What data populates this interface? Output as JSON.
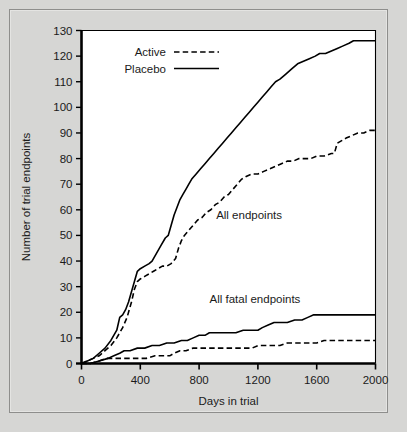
{
  "figure": {
    "background_color": "#d6d6d4",
    "plot_background_color": "#ffffff",
    "frame_border_color": "#8e8e8c",
    "ink_color": "#000000"
  },
  "chart_data": {
    "type": "line",
    "title": "",
    "xlabel": "Days in trial",
    "ylabel": "Number of trial endpoints",
    "xlim": [
      0,
      2000
    ],
    "ylim": [
      0,
      130
    ],
    "xticks": [
      0,
      400,
      800,
      1200,
      1600,
      2000
    ],
    "yticks": [
      0,
      10,
      20,
      30,
      40,
      50,
      60,
      70,
      80,
      90,
      100,
      110,
      120,
      130
    ],
    "xtick_labels": [
      "0",
      "400",
      "800",
      "1200",
      "1600",
      "2000"
    ],
    "ytick_labels": [
      "0",
      "10",
      "20",
      "30",
      "40",
      "50",
      "60",
      "70",
      "80",
      "90",
      "100",
      "110",
      "120",
      "130"
    ],
    "grid": false,
    "legend_position": "upper left inside",
    "legend": [
      {
        "name": "Active",
        "style": "dashed"
      },
      {
        "name": "Placebo",
        "style": "solid"
      }
    ],
    "annotations": [
      {
        "text": "All endpoints",
        "x": 1140,
        "y": 58
      },
      {
        "text": "All fatal endpoints",
        "x": 1180,
        "y": 25
      }
    ],
    "series": [
      {
        "name": "Placebo - All endpoints",
        "group": "All endpoints",
        "arm": "Placebo",
        "style": "solid",
        "final_value": 126,
        "points": [
          [
            0,
            0
          ],
          [
            40,
            1
          ],
          [
            80,
            2
          ],
          [
            120,
            4
          ],
          [
            160,
            6
          ],
          [
            200,
            9
          ],
          [
            240,
            13
          ],
          [
            260,
            18
          ],
          [
            280,
            19
          ],
          [
            300,
            21
          ],
          [
            320,
            24
          ],
          [
            340,
            28
          ],
          [
            360,
            32
          ],
          [
            380,
            36
          ],
          [
            400,
            37
          ],
          [
            430,
            38
          ],
          [
            460,
            39
          ],
          [
            480,
            40
          ],
          [
            510,
            43
          ],
          [
            540,
            46
          ],
          [
            570,
            49
          ],
          [
            590,
            50
          ],
          [
            610,
            54
          ],
          [
            630,
            58
          ],
          [
            650,
            61
          ],
          [
            670,
            64
          ],
          [
            690,
            66
          ],
          [
            710,
            68
          ],
          [
            730,
            70
          ],
          [
            750,
            72
          ],
          [
            780,
            74
          ],
          [
            810,
            76
          ],
          [
            840,
            78
          ],
          [
            870,
            80
          ],
          [
            900,
            82
          ],
          [
            930,
            84
          ],
          [
            960,
            86
          ],
          [
            990,
            88
          ],
          [
            1020,
            90
          ],
          [
            1050,
            92
          ],
          [
            1080,
            94
          ],
          [
            1110,
            96
          ],
          [
            1140,
            98
          ],
          [
            1170,
            100
          ],
          [
            1200,
            102
          ],
          [
            1230,
            104
          ],
          [
            1260,
            106
          ],
          [
            1290,
            108
          ],
          [
            1320,
            110
          ],
          [
            1350,
            111
          ],
          [
            1390,
            113
          ],
          [
            1430,
            115
          ],
          [
            1470,
            117
          ],
          [
            1510,
            118
          ],
          [
            1550,
            119
          ],
          [
            1590,
            120
          ],
          [
            1620,
            121
          ],
          [
            1660,
            121
          ],
          [
            1700,
            122
          ],
          [
            1740,
            123
          ],
          [
            1780,
            124
          ],
          [
            1820,
            125
          ],
          [
            1850,
            126
          ],
          [
            1900,
            126
          ],
          [
            1950,
            126
          ],
          [
            2000,
            126
          ]
        ]
      },
      {
        "name": "Active - All endpoints",
        "group": "All endpoints",
        "arm": "Active",
        "style": "dashed",
        "final_value": 91,
        "points": [
          [
            0,
            0
          ],
          [
            40,
            1
          ],
          [
            80,
            2
          ],
          [
            120,
            3
          ],
          [
            160,
            5
          ],
          [
            200,
            7
          ],
          [
            240,
            10
          ],
          [
            280,
            14
          ],
          [
            310,
            18
          ],
          [
            340,
            24
          ],
          [
            360,
            29
          ],
          [
            380,
            32
          ],
          [
            400,
            33
          ],
          [
            430,
            34
          ],
          [
            460,
            35
          ],
          [
            490,
            36
          ],
          [
            520,
            37
          ],
          [
            550,
            38
          ],
          [
            580,
            38
          ],
          [
            610,
            39
          ],
          [
            640,
            41
          ],
          [
            660,
            45
          ],
          [
            680,
            48
          ],
          [
            700,
            50
          ],
          [
            730,
            52
          ],
          [
            760,
            54
          ],
          [
            790,
            56
          ],
          [
            820,
            57
          ],
          [
            850,
            59
          ],
          [
            880,
            60
          ],
          [
            910,
            62
          ],
          [
            940,
            63
          ],
          [
            970,
            65
          ],
          [
            1000,
            66
          ],
          [
            1030,
            68
          ],
          [
            1060,
            70
          ],
          [
            1090,
            72
          ],
          [
            1120,
            73
          ],
          [
            1160,
            74
          ],
          [
            1200,
            74
          ],
          [
            1240,
            75
          ],
          [
            1280,
            76
          ],
          [
            1320,
            77
          ],
          [
            1360,
            78
          ],
          [
            1400,
            79
          ],
          [
            1440,
            79
          ],
          [
            1480,
            80
          ],
          [
            1520,
            80
          ],
          [
            1560,
            80
          ],
          [
            1600,
            81
          ],
          [
            1650,
            81
          ],
          [
            1700,
            82
          ],
          [
            1720,
            82
          ],
          [
            1740,
            86
          ],
          [
            1770,
            87
          ],
          [
            1800,
            88
          ],
          [
            1840,
            89
          ],
          [
            1880,
            90
          ],
          [
            1920,
            90
          ],
          [
            1960,
            91
          ],
          [
            2000,
            91
          ]
        ]
      },
      {
        "name": "Placebo - All fatal endpoints",
        "group": "All fatal endpoints",
        "arm": "Placebo",
        "style": "solid",
        "final_value": 19,
        "points": [
          [
            0,
            0
          ],
          [
            60,
            0
          ],
          [
            120,
            1
          ],
          [
            180,
            2
          ],
          [
            220,
            3
          ],
          [
            260,
            4
          ],
          [
            290,
            5
          ],
          [
            330,
            5
          ],
          [
            380,
            6
          ],
          [
            430,
            6
          ],
          [
            480,
            7
          ],
          [
            530,
            7
          ],
          [
            580,
            8
          ],
          [
            630,
            8
          ],
          [
            680,
            9
          ],
          [
            720,
            9
          ],
          [
            760,
            10
          ],
          [
            800,
            11
          ],
          [
            840,
            11
          ],
          [
            870,
            12
          ],
          [
            900,
            12
          ],
          [
            950,
            12
          ],
          [
            1000,
            12
          ],
          [
            1050,
            12
          ],
          [
            1100,
            13
          ],
          [
            1150,
            13
          ],
          [
            1200,
            13
          ],
          [
            1230,
            14
          ],
          [
            1270,
            15
          ],
          [
            1310,
            16
          ],
          [
            1350,
            16
          ],
          [
            1400,
            16
          ],
          [
            1450,
            17
          ],
          [
            1500,
            17
          ],
          [
            1540,
            18
          ],
          [
            1580,
            19
          ],
          [
            1620,
            19
          ],
          [
            1700,
            19
          ],
          [
            1800,
            19
          ],
          [
            1900,
            19
          ],
          [
            2000,
            19
          ]
        ]
      },
      {
        "name": "Active - All fatal endpoints",
        "group": "All fatal endpoints",
        "arm": "Active",
        "style": "dashed",
        "final_value": 9,
        "points": [
          [
            0,
            0
          ],
          [
            60,
            0
          ],
          [
            120,
            1
          ],
          [
            170,
            2
          ],
          [
            210,
            2
          ],
          [
            260,
            2
          ],
          [
            320,
            2
          ],
          [
            380,
            2
          ],
          [
            440,
            2
          ],
          [
            500,
            3
          ],
          [
            550,
            3
          ],
          [
            600,
            3
          ],
          [
            630,
            4
          ],
          [
            670,
            5
          ],
          [
            710,
            5
          ],
          [
            760,
            6
          ],
          [
            810,
            6
          ],
          [
            860,
            6
          ],
          [
            910,
            6
          ],
          [
            960,
            6
          ],
          [
            1010,
            6
          ],
          [
            1060,
            6
          ],
          [
            1110,
            6
          ],
          [
            1160,
            6
          ],
          [
            1200,
            7
          ],
          [
            1250,
            7
          ],
          [
            1300,
            7
          ],
          [
            1350,
            7
          ],
          [
            1400,
            8
          ],
          [
            1450,
            8
          ],
          [
            1500,
            8
          ],
          [
            1550,
            8
          ],
          [
            1600,
            8
          ],
          [
            1650,
            9
          ],
          [
            1700,
            9
          ],
          [
            1750,
            9
          ],
          [
            1800,
            9
          ],
          [
            1850,
            9
          ],
          [
            1900,
            9
          ],
          [
            1950,
            9
          ],
          [
            2000,
            9
          ]
        ]
      }
    ]
  }
}
